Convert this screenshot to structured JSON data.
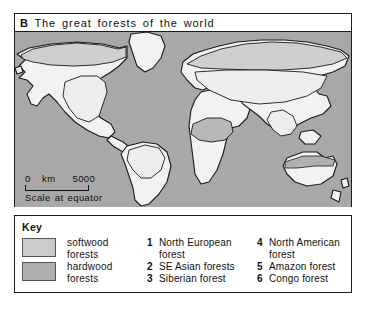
{
  "figure": {
    "panel_letter": "B",
    "title": "The great forests of the world"
  },
  "map": {
    "scale": {
      "zero": "0",
      "unit": "km",
      "max": "5000",
      "caption": "Scale at equator"
    },
    "colors": {
      "ocean": "#a8a8a8",
      "land": "#f2f2f2",
      "softwood": "#cfcfcf",
      "hardwood": "#ededed",
      "outline": "#1a1a1a"
    }
  },
  "key": {
    "heading": "Key",
    "swatches": [
      {
        "label": "softwood forests",
        "line1": "softwood",
        "line2": "forests",
        "color": "#cbcbcb"
      },
      {
        "label": "hardwood forests",
        "line1": "hardwood",
        "line2": "forests",
        "color": "#b0b0b0"
      }
    ],
    "numbered_column_1": [
      {
        "index": "1",
        "label": "North European forest",
        "line1": "North European",
        "line2": "forest"
      },
      {
        "index": "2",
        "label": "SE Asian forests",
        "line1": "SE Asian forests",
        "line2": ""
      },
      {
        "index": "3",
        "label": "Siberian forest",
        "line1": "Siberian forest",
        "line2": ""
      }
    ],
    "numbered_column_2": [
      {
        "index": "4",
        "label": "North American forest",
        "line1": "North American",
        "line2": "forest"
      },
      {
        "index": "5",
        "label": "Amazon forest",
        "line1": "Amazon forest",
        "line2": ""
      },
      {
        "index": "6",
        "label": "Congo forest",
        "line1": "Congo forest",
        "line2": ""
      }
    ]
  }
}
